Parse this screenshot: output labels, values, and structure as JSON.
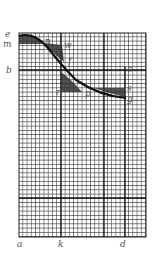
{
  "diagram": {
    "grid": {
      "x": 19,
      "y": 33,
      "width": 127,
      "height": 69,
      "full_height": 204,
      "cell": 4.2
    },
    "labels": {
      "e": "e",
      "m": "m",
      "b": "b",
      "a": "a",
      "k": "k",
      "d": "d",
      "n": "n",
      "w": "w",
      "f": "f",
      "r": "r",
      "p": "p",
      "c": "c",
      "s": "s",
      "g": "g"
    },
    "colors": {
      "grid": "#222222",
      "paper": "#ffffff",
      "label": "#555555",
      "shade": "#333333"
    }
  }
}
